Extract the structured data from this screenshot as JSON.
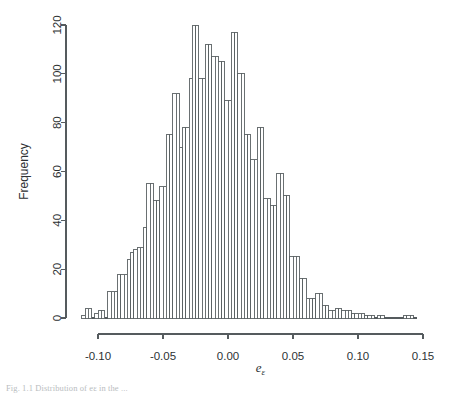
{
  "chart_data": {
    "type": "bar",
    "title": "",
    "subtitle": "",
    "xlabel": "e",
    "xlabel_sub": "ε",
    "ylabel": "Frequency",
    "xlim": [
      -0.1125,
      0.1475
    ],
    "ylim": [
      0,
      124
    ],
    "grid": false,
    "legend": null,
    "bin_width": 0.0025,
    "x_ticks": [
      -0.1,
      -0.05,
      0.0,
      0.05,
      0.1,
      0.15
    ],
    "x_tick_labels": [
      "-0.10",
      "-0.05",
      "0.00",
      "0.05",
      "0.10",
      "0.15"
    ],
    "y_ticks": [
      0,
      20,
      40,
      60,
      80,
      100,
      120
    ],
    "y_tick_labels": [
      "0",
      "20",
      "40",
      "60",
      "80",
      "100",
      "120"
    ],
    "bin_starts": [
      -0.1125,
      -0.11,
      -0.1075,
      -0.105,
      -0.1025,
      -0.1,
      -0.0975,
      -0.095,
      -0.0925,
      -0.09,
      -0.0875,
      -0.085,
      -0.0825,
      -0.08,
      -0.0775,
      -0.075,
      -0.0725,
      -0.07,
      -0.0675,
      -0.065,
      -0.0625,
      -0.06,
      -0.0575,
      -0.055,
      -0.0525,
      -0.05,
      -0.0475,
      -0.045,
      -0.0425,
      -0.04,
      -0.0375,
      -0.035,
      -0.0325,
      -0.03,
      -0.0275,
      -0.025,
      -0.0225,
      -0.02,
      -0.0175,
      -0.015,
      -0.0125,
      -0.01,
      -0.0075,
      -0.005,
      -0.0025,
      0.0,
      0.0025,
      0.005,
      0.0075,
      0.01,
      0.0125,
      0.015,
      0.0175,
      0.02,
      0.0225,
      0.025,
      0.0275,
      0.03,
      0.0325,
      0.035,
      0.0375,
      0.04,
      0.0425,
      0.045,
      0.0475,
      0.05,
      0.0525,
      0.055,
      0.0575,
      0.06,
      0.0625,
      0.065,
      0.0675,
      0.07,
      0.0725,
      0.075,
      0.0775,
      0.08,
      0.0825,
      0.085,
      0.0875,
      0.09,
      0.0925,
      0.095,
      0.0975,
      0.1,
      0.1025,
      0.105,
      0.1075,
      0.11,
      0.1125,
      0.115,
      0.1175,
      0.12,
      0.1225,
      0.125,
      0.1275,
      0.13,
      0.1325,
      0.135,
      0.1375,
      0.14,
      0.1425
    ],
    "values": [
      1,
      4,
      4,
      0,
      2,
      3,
      3,
      0,
      11,
      11,
      11,
      18,
      18,
      18,
      24,
      27,
      28,
      29,
      29,
      37,
      55,
      55,
      48,
      48,
      54,
      54,
      75,
      75,
      92,
      92,
      70,
      78,
      78,
      98,
      120,
      120,
      98,
      98,
      112,
      112,
      107,
      107,
      105,
      105,
      89,
      89,
      117,
      117,
      100,
      100,
      75,
      75,
      65,
      65,
      78,
      78,
      49,
      49,
      46,
      46,
      59,
      59,
      50,
      50,
      25,
      25,
      25,
      16,
      16,
      8,
      8,
      8,
      10,
      10,
      5,
      5,
      3,
      3,
      4,
      4,
      3,
      3,
      3,
      2,
      2,
      2,
      2,
      1,
      1,
      1,
      0,
      1,
      1,
      0,
      0,
      0,
      0,
      0,
      0,
      1,
      1,
      1,
      0
    ]
  },
  "figure": {
    "caption": "Fig. 1.1  Distribution of eε in the ...",
    "background_color": "#ffffff",
    "bar_fill_color": "#ffffff",
    "bar_stroke_color": "#5a6063",
    "axis_color": "#555b5e",
    "text_color": "#2d3133"
  }
}
